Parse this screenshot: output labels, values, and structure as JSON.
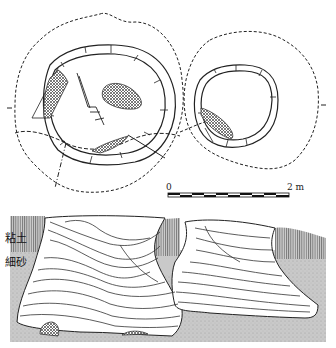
{
  "figure": {
    "plan_view": {
      "pits": [
        {
          "name": "left-pit",
          "features": [
            "outer-dashed-boundary",
            "pit-rim-double-line",
            "hatched-stone-west",
            "hatched-stone-center",
            "hatched-stone-south",
            "wooden-stake-lines"
          ]
        },
        {
          "name": "right-pit",
          "features": [
            "outer-dashed-boundary",
            "pit-rim-double-line",
            "hatched-stone-southwest"
          ]
        }
      ]
    },
    "scale_bar": {
      "start_label": "0",
      "end_label": "2 m",
      "segments": 10
    },
    "section_view": {
      "soil_labels": {
        "clay": "粘土",
        "fine_sand": "細砂"
      }
    },
    "colors": {
      "line": "#222222",
      "clay_fill": "#b5b5b5",
      "sand_fill": "#c8c8c8",
      "hatch": "#555555",
      "background": "#ffffff"
    }
  }
}
